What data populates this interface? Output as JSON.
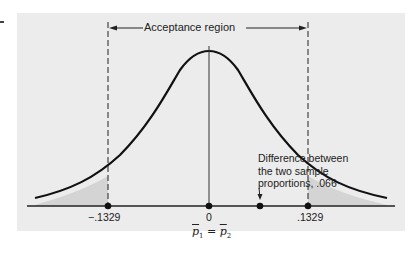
{
  "diagram": {
    "type": "normal-distribution-hypothesis-test",
    "region_label": "Acceptance region",
    "annotation": {
      "line1": "Difference between",
      "line2": "the two sample",
      "line3": "proportions, .066"
    },
    "ticks": {
      "lower": "−.1329",
      "center": "0",
      "upper": ".1329"
    },
    "center_label": {
      "p1": "p",
      "sub1": "1",
      "eq": " = ",
      "p2": "p",
      "sub2": "2"
    },
    "values": {
      "lower_critical": -0.1329,
      "upper_critical": 0.1329,
      "sample_difference": 0.066,
      "mean": 0
    },
    "colors": {
      "background": "#ececec",
      "curve": "#111111",
      "shaded_tail": "#d6d6d6",
      "dashed_line": "#222222"
    }
  }
}
